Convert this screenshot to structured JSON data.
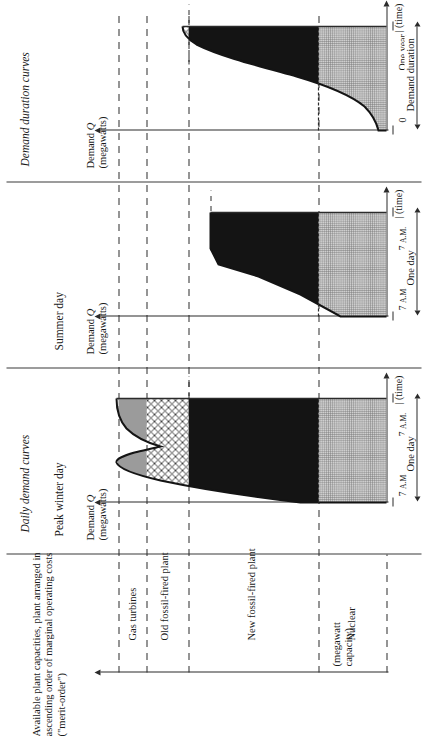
{
  "figure": {
    "headings": {
      "capacity_column": "Available plant capacities, plant arranged in ascending order of marginal operating costs (\"merit-order\")",
      "daily_demand_curves": "Daily demand curves",
      "demand_duration_curves": "Demand duration curves"
    },
    "panels": [
      {
        "id": "capacity",
        "title": "",
        "axis_label_line1": "(megawatt",
        "axis_label_line2": "capacity)",
        "capacity_labels": [
          "Gas turbines",
          "Old fossil-fired plant",
          "New fossil-fired plant",
          "Nuclear"
        ]
      },
      {
        "id": "peak-winter-day",
        "title": "Peak winter day",
        "axis_label_line1": "Demand Q",
        "axis_label_line2": "(megawatts)",
        "axis_symbol": "Q",
        "time_axis_label": "(time)",
        "tick_left": "7 A.M.",
        "tick_right": "7 A.M.",
        "bracket_label": "One day"
      },
      {
        "id": "summer-day",
        "title": "Summer day",
        "axis_label_line1": "Demand Q",
        "axis_label_line2": "(megawatts)",
        "axis_symbol": "Q",
        "time_axis_label": "(time)",
        "tick_left": "7 A.M.",
        "tick_right": "7 A.M.",
        "bracket_label": "One day"
      },
      {
        "id": "demand-duration",
        "title": "",
        "axis_label_line1": "Demand Q",
        "axis_label_line2": "(megawatts)",
        "axis_symbol": "Q",
        "time_axis_label": "(time)",
        "tick_left": "0",
        "tick_right": "One year",
        "bracket_label": "Demand duration"
      }
    ],
    "colors": {
      "ink": "#1a1a1a",
      "rule": "#2b2b2b",
      "nuclear_fill": "#cfcfcf",
      "new_fossil_fill": "#141414",
      "gas_turbine_fill": "#9b9b9b",
      "paper": "#ffffff"
    }
  },
  "chart_data": [
    {
      "type": "area",
      "id": "peak-winter-day",
      "title": "Peak winter day",
      "xlabel": "(time)",
      "ylabel": "Demand Q (megawatts)",
      "xticklabels": [
        "7 A.M.",
        "7 A.M."
      ],
      "xlim_label": "One day",
      "ylim": [
        0,
        100
      ],
      "grid": false,
      "capacity_levels": {
        "nuclear": 38,
        "new_fossil": 74,
        "old_fossil": 86,
        "gas_turbines": 94
      },
      "x": [
        0,
        8,
        16,
        24,
        32,
        40,
        48,
        56,
        64,
        72,
        80,
        88,
        96,
        100
      ],
      "demand": [
        38,
        50,
        62,
        72,
        80,
        88,
        92,
        84,
        90,
        88,
        84,
        78,
        74,
        74
      ]
    },
    {
      "type": "area",
      "id": "summer-day",
      "title": "Summer day",
      "xlabel": "(time)",
      "ylabel": "Demand Q (megawatts)",
      "xticklabels": [
        "7 A.M.",
        "7 A.M."
      ],
      "xlim_label": "One day",
      "ylim": [
        0,
        100
      ],
      "grid": false,
      "capacity_levels": {
        "nuclear": 38,
        "new_fossil": 74,
        "old_fossil": 86,
        "gas_turbines": 94
      },
      "x": [
        0,
        14,
        28,
        42,
        56,
        70,
        84,
        100
      ],
      "demand": [
        38,
        48,
        58,
        64,
        70,
        72,
        72,
        72
      ]
    },
    {
      "type": "area",
      "id": "demand-duration",
      "title": "Demand duration curves",
      "xlabel": "(time)",
      "ylabel": "Demand Q (megawatts)",
      "xticklabels": [
        "0",
        "One year"
      ],
      "xlim_label": "Demand duration",
      "ylim": [
        0,
        100
      ],
      "grid": false,
      "capacity_levels": {
        "nuclear": 38,
        "new_fossil": 74,
        "old_fossil": 86,
        "gas_turbines": 94
      },
      "x": [
        0,
        4,
        10,
        18,
        28,
        40,
        52,
        64,
        76,
        88,
        96,
        100
      ],
      "demand": [
        94,
        88,
        82,
        74,
        66,
        58,
        52,
        47,
        43,
        40,
        38,
        38
      ]
    }
  ]
}
